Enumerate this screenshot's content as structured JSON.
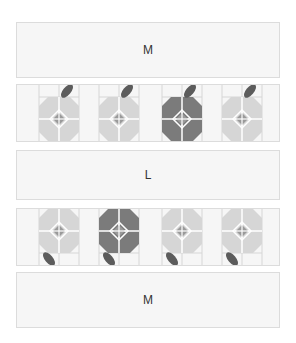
{
  "boxes": [
    {
      "label": "M"
    },
    {
      "label": "L"
    },
    {
      "label": "M"
    }
  ],
  "tile_rows": [
    {
      "orientation": "leaf-top",
      "tiles": [
        {
          "state": "light"
        },
        {
          "state": "light"
        },
        {
          "state": "dark"
        },
        {
          "state": "light"
        }
      ]
    },
    {
      "orientation": "leaf-bottom",
      "tiles": [
        {
          "state": "light"
        },
        {
          "state": "dark"
        },
        {
          "state": "light"
        },
        {
          "state": "light"
        }
      ]
    }
  ],
  "colors": {
    "background": "#f6f6f6",
    "border": "#dcdcdc",
    "grid_line": "#d6d6d6",
    "octagon_light": "#d6d6d6",
    "octagon_dark": "#7b7b7b",
    "leaf": "#5c5c5c",
    "diamond": "#9a9a9a",
    "cross": "#ffffff"
  }
}
